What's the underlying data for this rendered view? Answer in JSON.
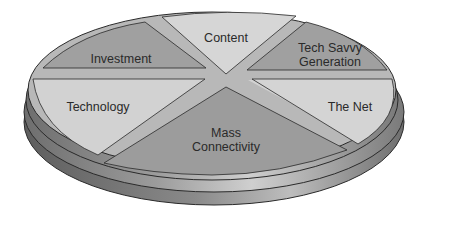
{
  "diagram": {
    "type": "3d-segmented-pie",
    "segments": [
      {
        "id": "content",
        "lines": [
          "Content"
        ]
      },
      {
        "id": "tech-savvy-generation",
        "lines": [
          "Tech Savvy",
          "Generation"
        ]
      },
      {
        "id": "the-net",
        "lines": [
          "The Net"
        ]
      },
      {
        "id": "mass-connectivity",
        "lines": [
          "Mass",
          "Connectivity"
        ]
      },
      {
        "id": "technology",
        "lines": [
          "Technology"
        ]
      },
      {
        "id": "investment",
        "lines": [
          "Investment"
        ]
      }
    ],
    "colors": {
      "light": "#d4d4d4",
      "dark": "#9a9a9a",
      "gap_light": "#c4c4c4",
      "gap_dark": "#8a8a8a",
      "outline": "#2a2a2a",
      "side_light": "#bdbdbd",
      "side_dark": "#7d7d7d"
    }
  }
}
